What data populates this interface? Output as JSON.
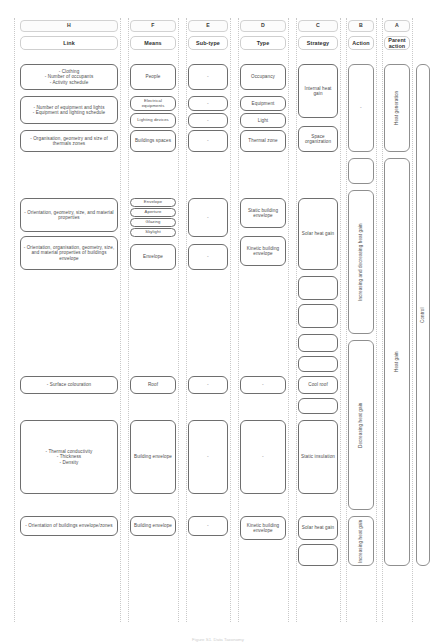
{
  "figure": {
    "caption": "Figure S1. Data Taxonomy"
  },
  "columns": [
    {
      "code": "H",
      "title": "Link"
    },
    {
      "code": "F",
      "title": "Means"
    },
    {
      "code": "E",
      "title": "Sub-type"
    },
    {
      "code": "D",
      "title": "Type"
    },
    {
      "code": "C",
      "title": "Strategy"
    },
    {
      "code": "B",
      "title": "Action"
    },
    {
      "code": "A",
      "title": "Parent action"
    }
  ],
  "link_cells": [
    {
      "text": "- Clothing\n- Number of occupants\n- Activity schedule"
    },
    {
      "text": "- Number of equipment and lights\n- Equipment and lighting schedule"
    },
    {
      "text": "- Organisation, geometry and size of thermals zones"
    },
    {
      "text": "- Orientation, geometry, size, and material properties"
    },
    {
      "text": "- Orientation, organisation, geometry, size, and material properties of buildings envelope"
    },
    {
      "text": "- Surface colouration"
    },
    {
      "text": "- Thermal conductivity\n- Thickness\n- Density"
    },
    {
      "text": "- Orientation of buildings envelope/zones"
    }
  ],
  "means_cells": [
    {
      "text": "People"
    },
    {
      "text": "Electrical equipments"
    },
    {
      "text": "Lighting devices"
    },
    {
      "text": "Buildings spaces"
    },
    {
      "text": "Envelope"
    },
    {
      "text": "Aperture"
    },
    {
      "text": "Glazing"
    },
    {
      "text": "Skylight"
    },
    {
      "text": "Envelope"
    },
    {
      "text": "Roof"
    },
    {
      "text": "Building envelope"
    },
    {
      "text": "Building envelope"
    }
  ],
  "subtype_cells": [
    {
      "text": "-"
    },
    {
      "text": "-"
    },
    {
      "text": "-"
    },
    {
      "text": "-"
    },
    {
      "text": "-"
    },
    {
      "text": "-"
    },
    {
      "text": "-"
    },
    {
      "text": "-"
    },
    {
      "text": "-"
    },
    {
      "text": "-"
    }
  ],
  "type_cells": [
    {
      "text": "Occupancy"
    },
    {
      "text": "Equipment"
    },
    {
      "text": "Light"
    },
    {
      "text": "Thermal zone"
    },
    {
      "text": "Static building envelope"
    },
    {
      "text": "Kinetic building envelope"
    },
    {
      "text": "-"
    },
    {
      "text": "-"
    },
    {
      "text": "Kinetic building envelope"
    }
  ],
  "strategy_cells": [
    {
      "text": "Internal heat gain"
    },
    {
      "text": "Space organization"
    },
    {
      "text": "Solar heat gain"
    },
    {
      "text": ""
    },
    {
      "text": ""
    },
    {
      "text": ""
    },
    {
      "text": ""
    },
    {
      "text": "Cool roof"
    },
    {
      "text": ""
    },
    {
      "text": "Static insulation"
    },
    {
      "text": "Solar heat gain"
    },
    {
      "text": ""
    }
  ],
  "action_cells": [
    {
      "text": "-"
    },
    {
      "text": ""
    },
    {
      "text": "Increasing and decreasing heat gain"
    },
    {
      "text": "Decreasing heat gain"
    },
    {
      "text": "Increasing heat gain"
    }
  ],
  "parent_action_cells": [
    {
      "text": "Heat generation"
    },
    {
      "text": "Heat gain"
    }
  ],
  "control_cells": [
    {
      "text": "Control"
    }
  ]
}
